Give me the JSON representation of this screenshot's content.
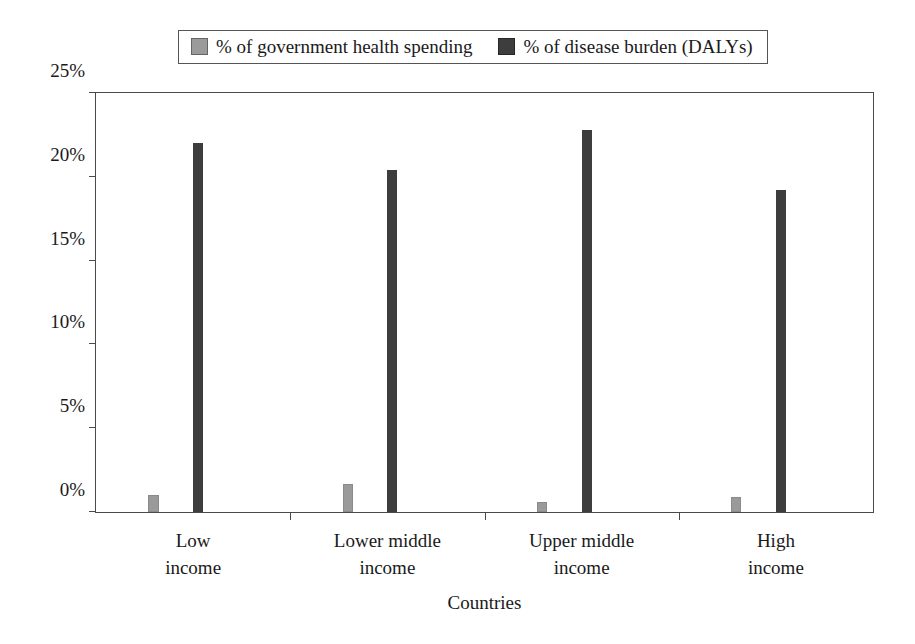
{
  "chart_data": {
    "type": "bar",
    "title": "",
    "xlabel": "Countries",
    "ylabel": "",
    "categories": [
      "Low income",
      "Lower middle income",
      "Upper middle income",
      "High income"
    ],
    "category_lines": [
      [
        "Low",
        "income"
      ],
      [
        "Lower middle",
        "income"
      ],
      [
        "Upper middle",
        "income"
      ],
      [
        "High",
        "income"
      ]
    ],
    "series": [
      {
        "name": "% of government health spending",
        "color": "#9a9a9a",
        "values": [
          1.0,
          1.65,
          0.6,
          0.9
        ]
      },
      {
        "name": "% of disease burden (DALYs)",
        "color": "#3d3d3d",
        "values": [
          22.0,
          20.4,
          22.8,
          19.2
        ]
      }
    ],
    "ylim": [
      0,
      25
    ],
    "ytick_values": [
      0,
      5,
      10,
      15,
      20,
      25
    ],
    "ytick_labels": [
      "0%",
      "5%",
      "10%",
      "15%",
      "20%",
      "25%"
    ],
    "grid": false,
    "legend_position": "top"
  },
  "legend": {
    "entries": [
      {
        "label": "% of government health spending",
        "swatch": "legend-swatch-light"
      },
      {
        "label": "% of disease burden (DALYs)",
        "swatch": "legend-swatch-dark"
      }
    ]
  },
  "axis": {
    "x_title": "Countries"
  }
}
